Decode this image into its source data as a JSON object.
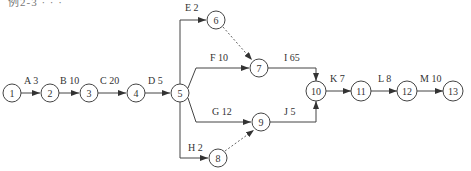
{
  "caption": "例2-3 · · ·",
  "nodes": [
    {
      "id": "1",
      "x": 12,
      "y": 93
    },
    {
      "id": "2",
      "x": 50,
      "y": 93
    },
    {
      "id": "3",
      "x": 89,
      "y": 93
    },
    {
      "id": "4",
      "x": 136,
      "y": 93
    },
    {
      "id": "5",
      "x": 180,
      "y": 93
    },
    {
      "id": "6",
      "x": 216,
      "y": 20
    },
    {
      "id": "7",
      "x": 259,
      "y": 68
    },
    {
      "id": "8",
      "x": 218,
      "y": 158
    },
    {
      "id": "9",
      "x": 261,
      "y": 122
    },
    {
      "id": "10",
      "x": 316,
      "y": 91
    },
    {
      "id": "11",
      "x": 361,
      "y": 91
    },
    {
      "id": "12",
      "x": 407,
      "y": 91
    },
    {
      "id": "13",
      "x": 453,
      "y": 91
    }
  ],
  "activities": [
    {
      "label": "A  3",
      "from": "1",
      "to": "2"
    },
    {
      "label": "B  10",
      "from": "2",
      "to": "3"
    },
    {
      "label": "C  20",
      "from": "3",
      "to": "4"
    },
    {
      "label": "D  5",
      "from": "4",
      "to": "5"
    },
    {
      "label": "E  2",
      "from": "5",
      "to": "6"
    },
    {
      "label": "F  10",
      "from": "5",
      "to": "7"
    },
    {
      "label": "G  12",
      "from": "5",
      "to": "9"
    },
    {
      "label": "H  2",
      "from": "5",
      "to": "8"
    },
    {
      "label": "I  65",
      "from": "7",
      "to": "10"
    },
    {
      "label": "J  5",
      "from": "9",
      "to": "10"
    },
    {
      "label": "K  7",
      "from": "10",
      "to": "11"
    },
    {
      "label": "L  8",
      "from": "11",
      "to": "12"
    },
    {
      "label": "M  10",
      "from": "12",
      "to": "13"
    }
  ],
  "dummy_activities": [
    {
      "from": "6",
      "to": "7"
    },
    {
      "from": "8",
      "to": "9"
    }
  ]
}
